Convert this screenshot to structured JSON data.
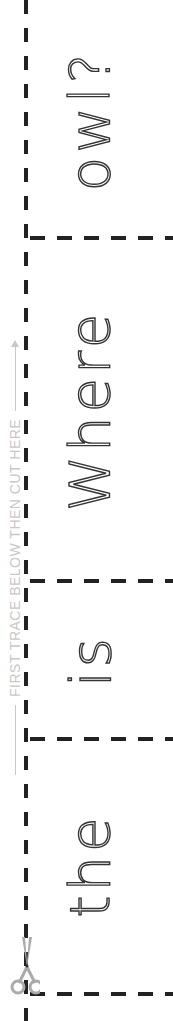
{
  "worksheet": {
    "type": "tracing worksheet",
    "guide_text": "FIRST TRACE BELOW THEN CUT HERE",
    "words_top_to_bottom": [
      "owl?",
      "Where",
      "is",
      "the"
    ],
    "sentence": "Where is the owl?",
    "cells": [
      {
        "word": "owl?",
        "top": 0,
        "bottom": 237
      },
      {
        "word": "Where",
        "top": 237,
        "bottom": 580
      },
      {
        "word": "is",
        "top": 580,
        "bottom": 738
      },
      {
        "word": "the",
        "top": 738,
        "bottom": 993
      }
    ],
    "icons": {
      "cut": "scissors-icon"
    },
    "colors": {
      "line": "#222222",
      "guide": "#c8c8c8",
      "trace": "#333333"
    }
  }
}
